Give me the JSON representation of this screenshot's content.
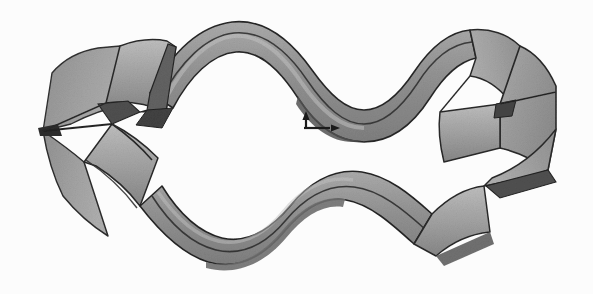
{
  "figure": {
    "title": "Wavy closed ribbon band (corrugated annular surface)",
    "domain_label": "scientific-illustration",
    "canvas": {
      "width": 593,
      "height": 294
    },
    "background_color": "#fcfcfc",
    "rendering": {
      "style": "shaded-grayscale-halftone",
      "outline_color": "#1c1c1c",
      "outline_width": 1.6,
      "paper_texture": true,
      "noise_opacity": 0.16
    },
    "palette": {
      "background": "#fcfcfc",
      "band_light": "#b8b8b8",
      "band_mid": "#9a9a9a",
      "band_base": "#8c8c8c",
      "band_dark": "#6e6e6e",
      "band_darker": "#575757",
      "band_shadow": "#3d3d3d",
      "edge_line": "#1c1c1c",
      "marker_color": "#141414"
    },
    "axis_marker": {
      "name": "origin-axis-marker",
      "origin_x": 306,
      "origin_y": 128,
      "vertical_arrow": {
        "label": "up",
        "dx": 0,
        "dy": -17,
        "head_size": 5
      },
      "horizontal_arrow": {
        "label": "right",
        "dx": 26,
        "dy": 0,
        "head_size": 5
      },
      "stroke_width": 2.2
    },
    "geometry": {
      "loop_type": "closed-corrugated-ribbon",
      "wave_count": 3,
      "bounding_box": {
        "x": 38,
        "y": 18,
        "width": 522,
        "height": 260
      },
      "left_tip": {
        "x": 43,
        "y": 131
      },
      "right_tip": {
        "x": 556,
        "y": 129
      },
      "top_crest": {
        "x": 232,
        "y": 22
      },
      "bottom_trough": {
        "x": 268,
        "y": 268
      }
    }
  }
}
